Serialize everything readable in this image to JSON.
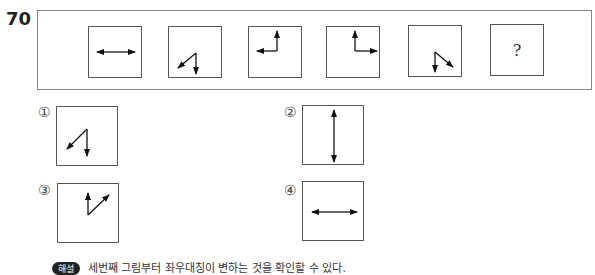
{
  "question": {
    "number": "70",
    "sequence": [
      {
        "id": 1,
        "figure": "double-headed-horizontal-arrow"
      },
      {
        "id": 2,
        "figure": "zigzag-arrows-down-and-down-left"
      },
      {
        "id": 3,
        "figure": "corner-arrows-left-and-up"
      },
      {
        "id": 4,
        "figure": "corner-arrows-up-and-right"
      },
      {
        "id": 5,
        "figure": "zigzag-arrows-down-and-down-right"
      },
      {
        "id": 6,
        "figure": "unknown",
        "label": "?"
      }
    ]
  },
  "options": [
    {
      "label": "①",
      "figure": "zigzag-arrows-down-and-down-left"
    },
    {
      "label": "②",
      "figure": "double-headed-vertical-arrow"
    },
    {
      "label": "③",
      "figure": "v-arrows-up-and-up-right"
    },
    {
      "label": "④",
      "figure": "double-headed-horizontal-arrow"
    }
  ],
  "explanation": {
    "badge": "해설",
    "text": "세번째 그림부터 좌우대칭이 변하는 것을 확인할 수 있다."
  }
}
